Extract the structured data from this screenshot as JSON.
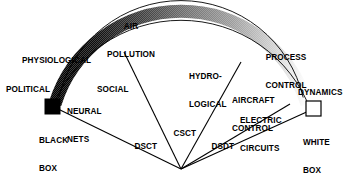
{
  "figure": {
    "type": "fan-spectrum-diagram",
    "title": "",
    "endpoints": {
      "left": {
        "label": "BLACK\nBOX",
        "line1": "BLACK",
        "line2": "BOX",
        "swatch": "#000000",
        "name": "black-box"
      },
      "right": {
        "label": "WHITE\nBOX",
        "line1": "WHITE",
        "line2": "BOX",
        "swatch": "#ffffff",
        "name": "white-box"
      }
    },
    "arc": {
      "gradient_from": "#000000",
      "gradient_to": "#ffffff",
      "stroke": "#000000",
      "stops": [
        "#000000",
        "#1a1a1a",
        "#4d4d4d",
        "#7a7a7a",
        "#a6a6a6",
        "#d4d4d4",
        "#ffffff"
      ]
    },
    "arc_labels": [
      {
        "id": "political",
        "text": "POLITICAL",
        "lines": [
          "POLITICAL"
        ]
      },
      {
        "id": "physiological",
        "text": "PHYSIOLOGICAL",
        "lines": [
          "PHYSIOLOGICAL"
        ]
      },
      {
        "id": "air-pollution",
        "text": "AIR POLLUTION",
        "lines": [
          "AIR",
          "POLLUTION"
        ]
      },
      {
        "id": "process-control",
        "text": "PROCESS CONTROL",
        "lines": [
          "PROCESS",
          "CONTROL"
        ]
      },
      {
        "id": "dynamics",
        "text": "DYNAMICS",
        "lines": [
          "DYNAMICS"
        ]
      }
    ],
    "inner_labels": [
      {
        "id": "neural-nets",
        "text": "NEURAL NETS",
        "lines": [
          "NEURAL",
          "NETS"
        ]
      },
      {
        "id": "social",
        "text": "SOCIAL",
        "lines": [
          "SOCIAL"
        ]
      },
      {
        "id": "hydrological",
        "text": "HYDRO-LOGICAL",
        "lines": [
          "HYDRO-",
          "LOGICAL"
        ]
      },
      {
        "id": "aircraft-control",
        "text": "AIRCRAFT CONTROL",
        "lines": [
          "AIRCRAFT",
          "CONTROL"
        ]
      },
      {
        "id": "electric-circuits",
        "text": "ELECTRIC CIRCUITS",
        "lines": [
          "ELECTRIC",
          "CIRCUITS"
        ]
      }
    ],
    "sector_labels": [
      {
        "id": "dsct",
        "text": "DSCT"
      },
      {
        "id": "csct",
        "text": "CSCT"
      },
      {
        "id": "dsdt",
        "text": "DSDT"
      }
    ]
  }
}
